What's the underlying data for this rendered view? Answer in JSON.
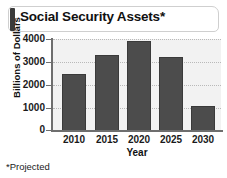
{
  "title": "Social Security Assets*",
  "footnote": "*Projected",
  "colors": {
    "bar": "#4c4c4c",
    "bar_border": "#3a3a3a",
    "axis": "#6e6e6e",
    "plot_background": "#f2f2f2",
    "gridline": "#b9b9b9",
    "title_accent": "#3b3b3b"
  },
  "chart_data": {
    "type": "bar",
    "title": "Social Security Assets*",
    "xlabel": "Year",
    "ylabel": "Billions of Dollars",
    "categories": [
      "2010",
      "2015",
      "2020",
      "2025",
      "2030"
    ],
    "values": [
      2500,
      3300,
      3900,
      3200,
      1100
    ],
    "ylim": [
      0,
      4000
    ],
    "yticks": [
      0,
      1000,
      2000,
      3000,
      4000
    ],
    "ytick_labels": [
      "0",
      "1000",
      "2000",
      "3000",
      "4000"
    ],
    "grid": true,
    "legend": null,
    "annotations": [
      "*Projected"
    ]
  }
}
